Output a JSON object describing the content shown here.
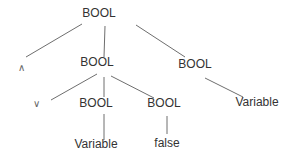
{
  "diagram": {
    "type": "parse-tree",
    "nodes": {
      "root": {
        "label": "BOOL",
        "x": 99,
        "y": 13
      },
      "and_op": {
        "label": "∧",
        "x": 21,
        "y": 68
      },
      "mid_bool": {
        "label": "BOOL",
        "x": 97,
        "y": 62
      },
      "right_bool": {
        "label": "BOOL",
        "x": 195,
        "y": 64
      },
      "or_op": {
        "label": "∨",
        "x": 36,
        "y": 104
      },
      "left_child_bool": {
        "label": "BOOL",
        "x": 96,
        "y": 103
      },
      "right_child_bool": {
        "label": "BOOL",
        "x": 164,
        "y": 103
      },
      "var_left": {
        "label": "Variable",
        "x": 96,
        "y": 144
      },
      "false_leaf": {
        "label": "false",
        "x": 167,
        "y": 143
      },
      "var_right": {
        "label": "Variable",
        "x": 257,
        "y": 102
      }
    },
    "edges": [
      {
        "from": "root",
        "to": "and_op",
        "x1": 82,
        "y1": 24,
        "x2": 26,
        "y2": 57
      },
      {
        "from": "root",
        "to": "mid_bool",
        "x1": 105,
        "y1": 26,
        "x2": 104,
        "y2": 57
      },
      {
        "from": "root",
        "to": "right_bool",
        "x1": 136,
        "y1": 25,
        "x2": 185,
        "y2": 57
      },
      {
        "from": "mid_bool",
        "to": "or_op",
        "x1": 97,
        "y1": 74,
        "x2": 51,
        "y2": 100
      },
      {
        "from": "mid_bool",
        "to": "left_child_bool",
        "x1": 104,
        "y1": 77,
        "x2": 104,
        "y2": 97
      },
      {
        "from": "mid_bool",
        "to": "right_child_bool",
        "x1": 111,
        "y1": 76,
        "x2": 154,
        "y2": 98
      },
      {
        "from": "right_bool",
        "to": "var_right",
        "x1": 205,
        "y1": 78,
        "x2": 243,
        "y2": 97
      },
      {
        "from": "left_child_bool",
        "to": "var_left",
        "x1": 104,
        "y1": 114,
        "x2": 104,
        "y2": 140
      },
      {
        "from": "right_child_bool",
        "to": "false_leaf",
        "x1": 167,
        "y1": 116,
        "x2": 167,
        "y2": 134
      }
    ]
  }
}
